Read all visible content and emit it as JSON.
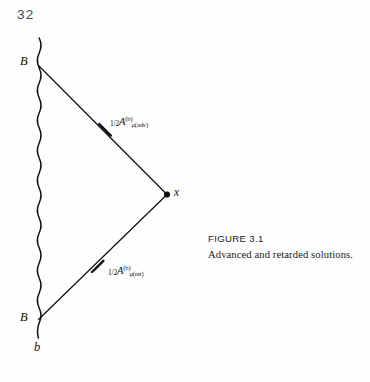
{
  "page": {
    "folio": "32",
    "background_color": "#fefefe",
    "ink_color": "#111111"
  },
  "figure": {
    "caption_label": "FIGURE 3.1",
    "caption_text": "Advanced and retarded solutions.",
    "points": {
      "b_worldline_top_label": "B",
      "b_worldline_bottom_label": "B",
      "b_lower_label": "b",
      "field_point_label": "x"
    },
    "expressions": {
      "advanced": {
        "coefficient": "1/2",
        "numerator": "1",
        "denominator": "2",
        "symbol": "A",
        "superscript": "(b)",
        "subscript": "μ(adv)"
      },
      "retarded": {
        "coefficient": "1/2",
        "numerator": "1",
        "denominator": "2",
        "symbol": "A",
        "superscript": "(b)",
        "subscript": "μ(ret)"
      }
    },
    "elements": {
      "worldline_name": "wavy-worldline",
      "advanced_ray_name": "advanced-ray",
      "retarded_ray_name": "retarded-ray"
    }
  }
}
